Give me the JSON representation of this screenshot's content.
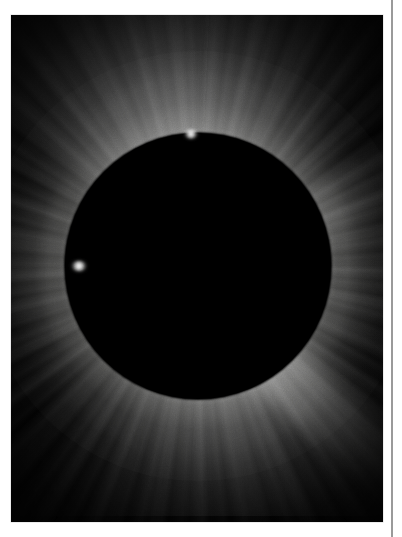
{
  "page": {
    "background_color": "#ffffff",
    "width": 402,
    "height": 537
  },
  "column_rule": {
    "color": "#9a9a9a",
    "orientation": "vertical",
    "x": 391
  },
  "photo": {
    "subject": "total-solar-eclipse-corona",
    "alt_text": "Black-and-white photograph of a total solar eclipse: the black disk of the Moon fully covering the Sun, surrounded by the bright white solar corona with radiating streamers against a dark sky.",
    "caption": "",
    "frame_color": "#000000",
    "background_color": "#010101",
    "corona_color": "#ffffff",
    "disk_color": "#000000",
    "left": 11,
    "top": 15,
    "width": 372,
    "height": 507
  },
  "eclipse": {
    "disk_center_x_pct": 50.3,
    "disk_center_y_pct": 49.6,
    "disk_diameter_px": 266,
    "features": [
      {
        "name": "polar-plume-fan-north",
        "direction": "up",
        "intensity": 0.4
      },
      {
        "name": "streamer-fan-south",
        "direction": "down",
        "intensity": 0.26
      },
      {
        "name": "equatorial-extension",
        "direction": "east-west",
        "intensity": 0.38
      },
      {
        "name": "streamer-southeast",
        "direction": "lower-right",
        "intensity": 0.3
      },
      {
        "name": "streamer-northeast",
        "direction": "upper-right",
        "intensity": 0.22
      },
      {
        "name": "streamer-northwest",
        "direction": "upper-left",
        "intensity": 0.2
      },
      {
        "name": "streamer-southwest",
        "direction": "lower-left",
        "intensity": 0.22
      },
      {
        "name": "prominence-west-limb",
        "direction": "left-limb",
        "intensity": 1.0
      },
      {
        "name": "prominence-north-limb",
        "direction": "top-limb",
        "intensity": 1.0
      }
    ]
  }
}
